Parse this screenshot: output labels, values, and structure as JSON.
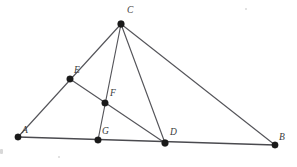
{
  "figure": {
    "width": 297,
    "height": 167,
    "background_color": "#ffffff",
    "line_color": "#55555a",
    "dot_color": "#1a1a1a",
    "label_color": "#3a3a3a"
  },
  "points": [
    {
      "id": "A",
      "label": "A",
      "x": 18,
      "y": 137,
      "label_x": 22,
      "label_y": 126,
      "dot_r": 3.2
    },
    {
      "id": "B",
      "label": "B",
      "x": 275,
      "y": 145,
      "label_x": 279,
      "label_y": 133,
      "dot_r": 3.2
    },
    {
      "id": "C",
      "label": "C",
      "x": 121,
      "y": 24,
      "label_x": 127,
      "label_y": 6,
      "dot_r": 3.4
    },
    {
      "id": "D",
      "label": "D",
      "x": 165,
      "y": 143,
      "label_x": 170,
      "label_y": 128,
      "dot_r": 3.4
    },
    {
      "id": "E",
      "label": "E",
      "x": 70,
      "y": 79,
      "label_x": 74,
      "label_y": 66,
      "dot_r": 3.3
    },
    {
      "id": "F",
      "label": "F",
      "x": 105,
      "y": 103,
      "label_x": 110,
      "label_y": 89,
      "dot_r": 3.3
    },
    {
      "id": "G",
      "label": "G",
      "x": 98,
      "y": 140,
      "label_x": 102,
      "label_y": 127,
      "dot_r": 3.3
    }
  ],
  "segments": [
    {
      "id": "AB",
      "from": "A",
      "to": "B",
      "style": "base"
    },
    {
      "id": "AC",
      "from": "A",
      "to": "C",
      "style": "normal"
    },
    {
      "id": "CB",
      "from": "C",
      "to": "B",
      "style": "normal"
    },
    {
      "id": "CG",
      "from": "C",
      "to": "G",
      "style": "normal"
    },
    {
      "id": "CD",
      "from": "C",
      "to": "D",
      "style": "normal"
    },
    {
      "id": "ED",
      "from": "E",
      "to": "D",
      "style": "normal"
    }
  ],
  "notes": {
    "collinear_on_AC": [
      "A",
      "E",
      "C"
    ],
    "collinear_on_AB": [
      "A",
      "G",
      "D",
      "B"
    ],
    "collinear_on_CG": [
      "C",
      "F",
      "G"
    ],
    "collinear_on_ED": [
      "E",
      "F",
      "D"
    ]
  }
}
